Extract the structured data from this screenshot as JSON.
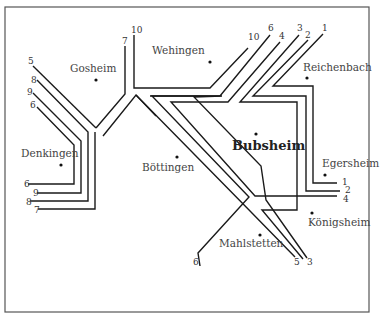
{
  "diagram": {
    "title": "",
    "places": [
      {
        "id": "gosheim",
        "name": "Gosheim",
        "x": 96,
        "y": 80,
        "lx": 70,
        "ly": 72,
        "major": false
      },
      {
        "id": "wehingen",
        "name": "Wehingen",
        "x": 210,
        "y": 62,
        "lx": 152,
        "ly": 54,
        "major": false
      },
      {
        "id": "reichenbach",
        "name": "Reichenbach",
        "x": 307,
        "y": 78,
        "lx": 303,
        "ly": 71,
        "major": false
      },
      {
        "id": "bubsheim",
        "name": "Bubsheim",
        "x": 256,
        "y": 134,
        "lx": 232,
        "ly": 150,
        "major": true
      },
      {
        "id": "denkingen",
        "name": "Denkingen",
        "x": 61,
        "y": 165,
        "lx": 21,
        "ly": 157,
        "major": false
      },
      {
        "id": "boettingen",
        "name": "Böttingen",
        "x": 177,
        "y": 157,
        "lx": 142,
        "ly": 171,
        "major": false
      },
      {
        "id": "egersheim",
        "name": "Egersheim",
        "x": 325,
        "y": 175,
        "lx": 322,
        "ly": 167,
        "major": false
      },
      {
        "id": "koenigsheim",
        "name": "Königsheim",
        "x": 312,
        "y": 213,
        "lx": 308,
        "ly": 226,
        "major": false
      },
      {
        "id": "mahlstetten",
        "name": "Mahlstetten",
        "x": 260,
        "y": 235,
        "lx": 219,
        "ly": 247,
        "major": false
      }
    ],
    "line_labels": [
      {
        "text": "5",
        "x": 28,
        "y": 64
      },
      {
        "text": "8",
        "x": 31,
        "y": 83
      },
      {
        "text": "9",
        "x": 27,
        "y": 95
      },
      {
        "text": "6",
        "x": 30,
        "y": 108
      },
      {
        "text": "10",
        "x": 131,
        "y": 33
      },
      {
        "text": "7",
        "x": 122,
        "y": 44
      },
      {
        "text": "10",
        "x": 248,
        "y": 40
      },
      {
        "text": "6",
        "x": 268,
        "y": 31
      },
      {
        "text": "4",
        "x": 279,
        "y": 39
      },
      {
        "text": "3",
        "x": 297,
        "y": 31
      },
      {
        "text": "2",
        "x": 305,
        "y": 38
      },
      {
        "text": "1",
        "x": 322,
        "y": 31
      },
      {
        "text": "6",
        "x": 24,
        "y": 187
      },
      {
        "text": "9",
        "x": 33,
        "y": 196
      },
      {
        "text": "8",
        "x": 26,
        "y": 205
      },
      {
        "text": "7",
        "x": 34,
        "y": 213
      },
      {
        "text": "1",
        "x": 342,
        "y": 185
      },
      {
        "text": "2",
        "x": 345,
        "y": 193
      },
      {
        "text": "4",
        "x": 343,
        "y": 202
      },
      {
        "text": "6",
        "x": 193,
        "y": 265
      },
      {
        "text": "5",
        "x": 294,
        "y": 265
      },
      {
        "text": "3",
        "x": 307,
        "y": 265
      }
    ],
    "colors": {
      "background": "#ffffff",
      "lines": "#1a1a1a",
      "frame": "#555555",
      "text": "#444444"
    }
  }
}
